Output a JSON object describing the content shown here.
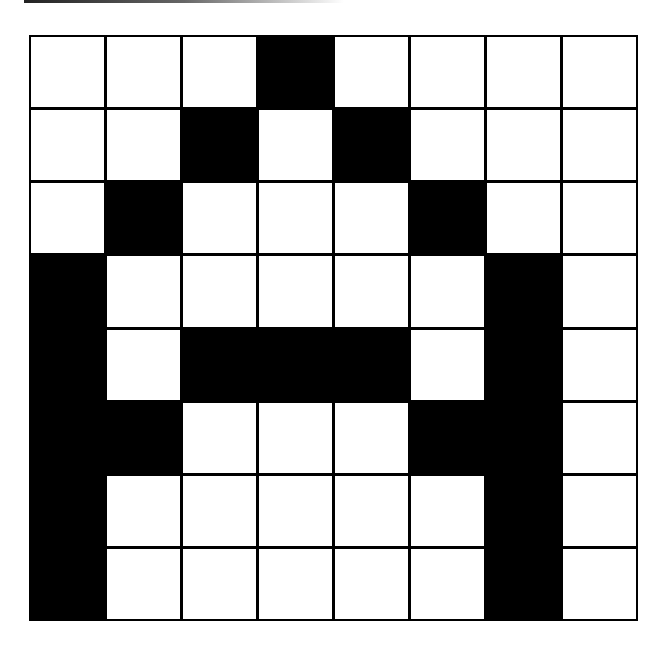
{
  "puzzle": {
    "rows": 8,
    "cols": 8,
    "colors": {
      "filled": "#000000",
      "empty": "#ffffff",
      "grid_line": "#000000"
    },
    "cells": [
      [
        0,
        0,
        0,
        1,
        0,
        0,
        0,
        0
      ],
      [
        0,
        0,
        1,
        0,
        1,
        0,
        0,
        0
      ],
      [
        0,
        1,
        0,
        0,
        0,
        1,
        0,
        0
      ],
      [
        1,
        0,
        0,
        0,
        0,
        0,
        1,
        0
      ],
      [
        1,
        0,
        1,
        1,
        1,
        0,
        1,
        0
      ],
      [
        1,
        1,
        0,
        0,
        0,
        1,
        1,
        0
      ],
      [
        1,
        0,
        0,
        0,
        0,
        0,
        1,
        0
      ],
      [
        1,
        0,
        0,
        0,
        0,
        0,
        1,
        0
      ]
    ]
  }
}
